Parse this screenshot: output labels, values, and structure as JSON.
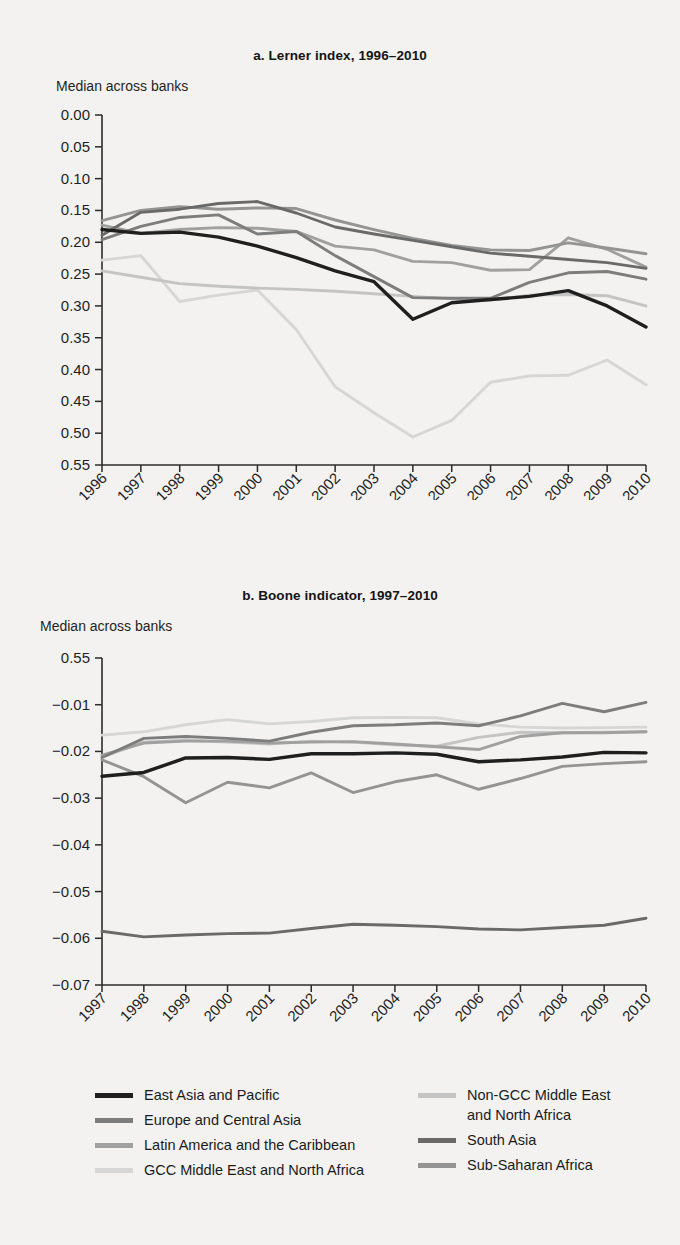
{
  "figure": {
    "background_color": "#f3f2f0"
  },
  "panels": [
    {
      "id": "a",
      "title": "a.  Lerner index, 1996–2010",
      "axis_caption": "Median across banks"
    },
    {
      "id": "b",
      "title": "b.  Boone indicator, 1997–2010",
      "axis_caption": "Median across banks"
    }
  ],
  "legend": {
    "left": [
      {
        "label": "East Asia and Pacific",
        "color": "#1f1f1f"
      },
      {
        "label": "Europe and Central Asia",
        "color": "#7d7d7d"
      },
      {
        "label": "Latin America and the Caribbean",
        "color": "#a0a0a0"
      },
      {
        "label": "GCC Middle East and North Africa",
        "color": "#d6d6d6"
      }
    ],
    "right": [
      {
        "label": "Non-GCC Middle East\nand North Africa",
        "color": "#c4c4c4"
      },
      {
        "label": "South Asia",
        "color": "#6a6a6a"
      },
      {
        "label": "Sub-Saharan Africa",
        "color": "#949494"
      }
    ]
  },
  "chart_data": [
    {
      "type": "line",
      "title": "a.  Lerner index, 1996–2010",
      "xlabel": "",
      "ylabel": "Median across banks",
      "ylim": [
        0.0,
        0.55
      ],
      "yticks": [
        "0.00",
        "0.05",
        "0.10",
        "0.15",
        "0.20",
        "0.25",
        "0.30",
        "0.35",
        "0.40",
        "0.45",
        "0.50",
        "0.55"
      ],
      "ytick_values": [
        0.0,
        0.05,
        0.1,
        0.15,
        0.2,
        0.25,
        0.3,
        0.35,
        0.4,
        0.45,
        0.5,
        0.55
      ],
      "grid": false,
      "legend_position": "below-figure",
      "categories": [
        "1996",
        "1997",
        "1998",
        "1999",
        "2000",
        "2001",
        "2002",
        "2003",
        "2004",
        "2005",
        "2006",
        "2007",
        "2008",
        "2009",
        "2010"
      ],
      "x": [
        1996,
        1997,
        1998,
        1999,
        2000,
        2001,
        2002,
        2003,
        2004,
        2005,
        2006,
        2007,
        2008,
        2009,
        2010
      ],
      "series": [
        {
          "name": "East Asia and Pacific",
          "color": "#1f1f1f",
          "values": [
            0.18,
            0.186,
            0.184,
            0.192,
            0.206,
            0.224,
            0.245,
            0.262,
            0.321,
            0.295,
            0.29,
            0.285,
            0.276,
            0.3,
            0.333
          ]
        },
        {
          "name": "Europe and Central Asia",
          "color": "#7d7d7d",
          "values": [
            0.196,
            0.175,
            0.161,
            0.157,
            0.187,
            0.183,
            0.221,
            0.254,
            0.287,
            0.288,
            0.288,
            0.263,
            0.248,
            0.246,
            0.258
          ]
        },
        {
          "name": "Latin America and the Caribbean",
          "color": "#a0a0a0",
          "values": [
            0.173,
            0.186,
            0.18,
            0.177,
            0.178,
            0.183,
            0.206,
            0.212,
            0.23,
            0.232,
            0.244,
            0.243,
            0.193,
            0.211,
            0.239
          ]
        },
        {
          "name": "GCC Middle East and North Africa",
          "color": "#d6d6d6",
          "values": [
            0.228,
            0.221,
            0.293,
            0.283,
            0.275,
            0.337,
            0.427,
            0.468,
            0.506,
            0.48,
            0.42,
            0.41,
            0.409,
            0.385,
            0.424
          ]
        },
        {
          "name": "Non-GCC Middle East and North Africa",
          "color": "#c4c4c4",
          "values": [
            0.245,
            0.255,
            0.265,
            0.269,
            0.272,
            0.274,
            0.277,
            0.281,
            0.285,
            0.289,
            0.291,
            0.283,
            0.282,
            0.284,
            0.3
          ]
        },
        {
          "name": "South Asia",
          "color": "#6a6a6a",
          "values": [
            0.189,
            0.153,
            0.148,
            0.139,
            0.136,
            0.154,
            0.176,
            0.187,
            0.197,
            0.207,
            0.217,
            0.222,
            0.227,
            0.232,
            0.241
          ]
        },
        {
          "name": "Sub-Saharan Africa",
          "color": "#949494",
          "values": [
            0.166,
            0.15,
            0.144,
            0.148,
            0.146,
            0.147,
            0.165,
            0.18,
            0.194,
            0.205,
            0.212,
            0.213,
            0.201,
            0.209,
            0.218
          ]
        }
      ]
    },
    {
      "type": "line",
      "title": "b.  Boone indicator, 1997–2010",
      "xlabel": "",
      "ylabel": "Median across banks",
      "ylim": [
        -0.07,
        0.0
      ],
      "yticks": [
        "0.55",
        "−0.01",
        "−0.02",
        "−0.03",
        "−0.04",
        "−0.05",
        "−0.06",
        "−0.07"
      ],
      "ytick_values": [
        0.0,
        -0.01,
        -0.02,
        -0.03,
        -0.04,
        -0.05,
        -0.06,
        -0.07
      ],
      "grid": false,
      "legend_position": "below-figure",
      "categories": [
        "1997",
        "1998",
        "1999",
        "2000",
        "2001",
        "2002",
        "2003",
        "2004",
        "2005",
        "2006",
        "2007",
        "2008",
        "2009",
        "2010"
      ],
      "x": [
        1997,
        1998,
        1999,
        2000,
        2001,
        2002,
        2003,
        2004,
        2005,
        2006,
        2007,
        2008,
        2009,
        2010
      ],
      "series": [
        {
          "name": "East Asia and Pacific",
          "color": "#1f1f1f",
          "values": [
            -0.0253,
            -0.0245,
            -0.0214,
            -0.0213,
            -0.0217,
            -0.0205,
            -0.0205,
            -0.0203,
            -0.0206,
            -0.0222,
            -0.0218,
            -0.0212,
            -0.0202,
            -0.0203
          ]
        },
        {
          "name": "Europe and Central Asia",
          "color": "#7d7d7d",
          "values": [
            -0.0213,
            -0.0172,
            -0.0168,
            -0.0172,
            -0.0178,
            -0.0159,
            -0.0145,
            -0.0143,
            -0.0139,
            -0.0145,
            -0.0124,
            -0.0097,
            -0.0115,
            -0.0095
          ]
        },
        {
          "name": "Latin America and the Caribbean",
          "color": "#a0a0a0",
          "values": [
            -0.0208,
            -0.0182,
            -0.0178,
            -0.0178,
            -0.0182,
            -0.018,
            -0.0179,
            -0.0184,
            -0.019,
            -0.0196,
            -0.0168,
            -0.016,
            -0.016,
            -0.0158
          ]
        },
        {
          "name": "GCC Middle East and North Africa",
          "color": "#d6d6d6",
          "values": [
            -0.0165,
            -0.0158,
            -0.0143,
            -0.0132,
            -0.0141,
            -0.0136,
            -0.0128,
            -0.0127,
            -0.0128,
            -0.0141,
            -0.0148,
            -0.015,
            -0.0149,
            -0.0148
          ]
        },
        {
          "name": "Non-GCC Middle East and North Africa",
          "color": "#c4c4c4",
          "values": [
            -0.0212,
            -0.018,
            -0.0176,
            -0.018,
            -0.0184,
            -0.0178,
            -0.018,
            -0.0186,
            -0.0189,
            -0.017,
            -0.0159,
            -0.016,
            -0.0159,
            -0.0158
          ]
        },
        {
          "name": "South Asia",
          "color": "#6a6a6a",
          "values": [
            -0.0585,
            -0.0597,
            -0.0593,
            -0.059,
            -0.0589,
            -0.0579,
            -0.057,
            -0.0572,
            -0.0575,
            -0.058,
            -0.0582,
            -0.0577,
            -0.0572,
            -0.0557
          ]
        },
        {
          "name": "Sub-Saharan Africa",
          "color": "#949494",
          "values": [
            -0.0218,
            -0.0254,
            -0.031,
            -0.0266,
            -0.0278,
            -0.0246,
            -0.0288,
            -0.0265,
            -0.025,
            -0.0281,
            -0.0258,
            -0.0232,
            -0.0226,
            -0.0222
          ]
        }
      ]
    }
  ]
}
